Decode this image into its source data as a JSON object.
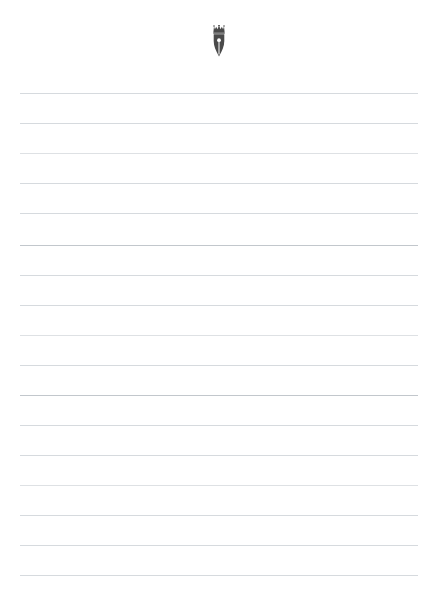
{
  "document": {
    "type": "lined-writing-paper",
    "background_color": "#ffffff",
    "width": 437,
    "height": 593
  },
  "header": {
    "logo": {
      "icon_name": "crowned-pen-nib-icon",
      "description": "fountain pen nib topped with a crown",
      "color": "#4a4a4a",
      "x": 212,
      "y": 27,
      "width": 18,
      "height": 32
    },
    "caption": ""
  },
  "ruled_lines": {
    "count": 17,
    "color": "#c9cdd2",
    "thickness": 1,
    "left_margin": 20,
    "right_margin": 19,
    "line_width": 398,
    "spacing": 30,
    "first_line_y": 93,
    "lines": [
      {
        "y": 93,
        "shade": "light"
      },
      {
        "y": 123,
        "shade": "light"
      },
      {
        "y": 153,
        "shade": "lighter"
      },
      {
        "y": 183,
        "shade": "light"
      },
      {
        "y": 213,
        "shade": "light"
      },
      {
        "y": 245,
        "shade": "dark"
      },
      {
        "y": 275,
        "shade": "light"
      },
      {
        "y": 305,
        "shade": "light"
      },
      {
        "y": 335,
        "shade": "lighter"
      },
      {
        "y": 365,
        "shade": "light"
      },
      {
        "y": 395,
        "shade": "dark"
      },
      {
        "y": 425,
        "shade": "light"
      },
      {
        "y": 455,
        "shade": "light"
      },
      {
        "y": 485,
        "shade": "lighter"
      },
      {
        "y": 515,
        "shade": "light"
      },
      {
        "y": 545,
        "shade": "light"
      },
      {
        "y": 575,
        "shade": "light"
      }
    ]
  }
}
